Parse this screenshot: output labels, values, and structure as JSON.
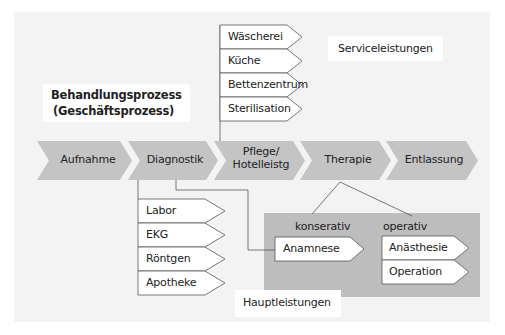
{
  "title": {
    "line1": "Behandlungsprozess",
    "line2": "(Geschäftsprozess)"
  },
  "process_steps": [
    {
      "label": "Aufnahme"
    },
    {
      "label": "Diagnostik"
    },
    {
      "label_line1": "Pflege/",
      "label_line2": "Hotelleistg"
    },
    {
      "label": "Therapie"
    },
    {
      "label": "Entlassung"
    }
  ],
  "service": {
    "group_label": "Serviceleistungen",
    "items": [
      "Wäscherei",
      "Küche",
      "Bettenzentrum",
      "Sterilisation"
    ]
  },
  "diagnostik_items": [
    "Labor",
    "EKG",
    "Röntgen",
    "Apotheke"
  ],
  "therapie": {
    "konservativ_label": "konserativ",
    "operativ_label": "operativ",
    "konservativ_items": [
      "Anamnese"
    ],
    "operativ_items": [
      "Anästhesie",
      "Operation"
    ]
  },
  "hauptleistungen_label": "Hauptleistungen",
  "colors": {
    "background_panel": "#f3f3f3",
    "chevron_fill": "#c4c4c4",
    "therapie_panel": "#bdbdbd",
    "box_fill": "#ffffff",
    "line": "#555555"
  }
}
